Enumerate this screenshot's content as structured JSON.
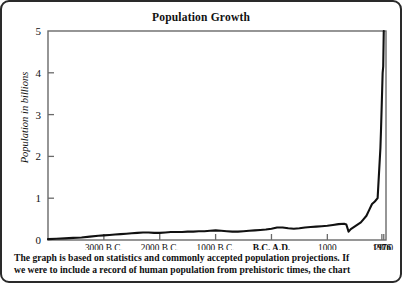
{
  "figure": {
    "caption_line_1": "The graph is based on statistics and commonly accepted population projections. If",
    "caption_line_2": "we were to include a record of human population from prehistoric times, the chart"
  },
  "chart_data": {
    "type": "line",
    "title": "Population Growth",
    "xlabel": "",
    "ylabel": "Population in billions",
    "ylim": [
      0,
      5
    ],
    "xlim": [
      -4000,
      2050
    ],
    "grid": false,
    "legend": null,
    "y_ticks": [
      "0",
      "1",
      "2",
      "3",
      "4",
      "5"
    ],
    "y_tick_values": [
      0,
      1,
      2,
      3,
      4,
      5
    ],
    "x_ticks": [
      {
        "label": "3000 B.C.",
        "value": -3000,
        "bold": false
      },
      {
        "label": "2000 B.C.",
        "value": -2000,
        "bold": false
      },
      {
        "label": "1000 B.C.",
        "value": -1000,
        "bold": false
      },
      {
        "label": "B.C. A.D.",
        "value": 0,
        "bold": true
      },
      {
        "label": "1000",
        "value": 1000,
        "bold": false
      },
      {
        "label": "1976",
        "value": 1976,
        "bold": true
      },
      {
        "label": "2000",
        "value": 2010,
        "bold": false
      }
    ],
    "series": [
      {
        "name": "World population",
        "color": "#111111",
        "x": [
          -4000,
          -3850,
          -3700,
          -3550,
          -3400,
          -3250,
          -3100,
          -3000,
          -2900,
          -2800,
          -2700,
          -2600,
          -2500,
          -2400,
          -2300,
          -2200,
          -2100,
          -2000,
          -1900,
          -1800,
          -1700,
          -1600,
          -1500,
          -1400,
          -1300,
          -1200,
          -1100,
          -1000,
          -900,
          -800,
          -700,
          -600,
          -500,
          -400,
          -300,
          -200,
          -100,
          0,
          100,
          200,
          300,
          400,
          500,
          600,
          700,
          800,
          900,
          1000,
          1100,
          1200,
          1300,
          1340,
          1380,
          1420,
          1500,
          1600,
          1650,
          1700,
          1750,
          1800,
          1850,
          1900,
          1927,
          1950,
          1960,
          1976,
          1990,
          2000,
          2010
        ],
        "y": [
          0.02,
          0.03,
          0.04,
          0.05,
          0.06,
          0.08,
          0.1,
          0.11,
          0.12,
          0.13,
          0.14,
          0.15,
          0.16,
          0.17,
          0.18,
          0.18,
          0.17,
          0.17,
          0.18,
          0.19,
          0.19,
          0.19,
          0.2,
          0.2,
          0.21,
          0.21,
          0.22,
          0.23,
          0.22,
          0.21,
          0.2,
          0.2,
          0.21,
          0.22,
          0.23,
          0.24,
          0.25,
          0.27,
          0.3,
          0.3,
          0.28,
          0.27,
          0.28,
          0.3,
          0.31,
          0.32,
          0.33,
          0.34,
          0.36,
          0.38,
          0.39,
          0.37,
          0.2,
          0.26,
          0.33,
          0.42,
          0.5,
          0.58,
          0.72,
          0.86,
          0.92,
          1.0,
          1.65,
          2.2,
          2.6,
          3.35,
          4.0,
          4.15,
          5.0
        ]
      }
    ],
    "annotations": []
  }
}
